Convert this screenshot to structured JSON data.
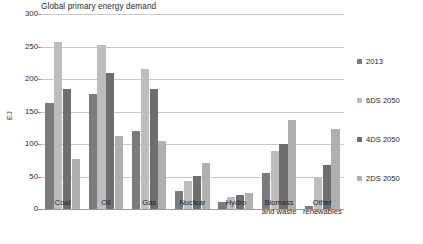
{
  "chart_data": {
    "type": "bar",
    "title": "Global primary energy demand",
    "xlabel": "",
    "ylabel": "EJ",
    "ylim": [
      0,
      300
    ],
    "yticks": [
      0,
      50,
      100,
      150,
      200,
      250,
      300
    ],
    "grid": true,
    "legend_position": "right",
    "categories": [
      "Coal",
      "Oil",
      "Gas",
      "Nuclear",
      "Hydro",
      "Biomass and waste",
      "Other renewables"
    ],
    "series": [
      {
        "name": "2013",
        "color": "#7b7b7b",
        "values": [
          163,
          177,
          120,
          27,
          11,
          55,
          4
        ]
      },
      {
        "name": "6DS 2050",
        "color": "#bdbdbd",
        "values": [
          257,
          252,
          216,
          43,
          19,
          90,
          47
        ]
      },
      {
        "name": "4DS 2050",
        "color": "#6e6e6e",
        "values": [
          185,
          209,
          185,
          51,
          21,
          100,
          68
        ]
      },
      {
        "name": "2DS 2050",
        "color": "#b0b0b0",
        "values": [
          77,
          113,
          104,
          71,
          24,
          137,
          123
        ]
      }
    ]
  },
  "category_labels": [
    {
      "line1": "Coal",
      "line2": ""
    },
    {
      "line1": "Oil",
      "line2": ""
    },
    {
      "line1": "Gas",
      "line2": ""
    },
    {
      "line1": "Nuclear",
      "line2": ""
    },
    {
      "line1": "Hydro",
      "line2": ""
    },
    {
      "line1": "Biomass",
      "line2": "and waste"
    },
    {
      "line1": "Other",
      "line2": "renewables"
    }
  ]
}
